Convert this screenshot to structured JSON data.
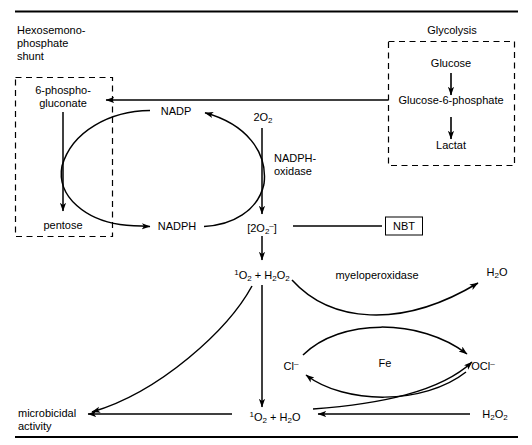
{
  "figure": {
    "section_titles": {
      "left": "Hexosemono-\nphosphate\nshunt",
      "right": "Glycolysis"
    },
    "hmp_box": {
      "substrate": "6-phospho-\ngluconate",
      "product": "pentose"
    },
    "glycolysis_box": {
      "step1": "Glucose",
      "step2": "Glucose-6-phosphate",
      "step3": "Lactat"
    },
    "nadp_cycle": {
      "oxidized": "NADP",
      "reduced": "NADPH"
    },
    "oxidase_column": {
      "oxygen": "2O",
      "oxygen_sub": "2",
      "enzyme": "NADPH-\noxidase",
      "superoxide_open": "[2O",
      "superoxide_sub": "2",
      "superoxide_sup": "–",
      "superoxide_close": "]",
      "nbt_label": "NBT"
    },
    "peroxide_node": {
      "singlet": "1",
      "o2": "O",
      "o2_sub": "2",
      "plus": " + H",
      "h_sub": "2",
      "o_label": "O",
      "o_sub": "2"
    },
    "myeloperoxidase": {
      "enzyme": "myeloperoxidase",
      "water": "H",
      "water_sub": "2",
      "water_o": "O",
      "chloride": "Cl",
      "chloride_sup": "–",
      "metal": "Fe",
      "hypochlorite": "OCl",
      "hypochlorite_sup": "–"
    },
    "outcome": {
      "singlet_water": "1",
      "label": "microbicidal\nactivity",
      "peroxide": "H",
      "peroxide_sub": "2",
      "peroxide_o": "O",
      "peroxide_o_sub": "2"
    },
    "colors": {
      "ink": "#000000",
      "background": "#ffffff"
    }
  }
}
